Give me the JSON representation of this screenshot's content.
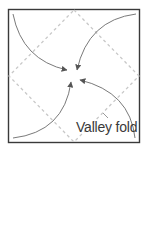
{
  "diagram": {
    "label": "Valley fold",
    "colors": {
      "border": "#3a3a3a",
      "dashed": "#c8c8c8",
      "arrow": "#7a7a7a",
      "text": "#3a3a3a"
    },
    "square": {
      "x": 8,
      "y": 9,
      "w": 132,
      "h": 134
    },
    "diamond": [
      [
        74,
        9
      ],
      [
        140,
        76
      ],
      [
        74,
        143
      ],
      [
        8,
        76
      ]
    ],
    "arrows": [
      {
        "from": "top-left",
        "to": "center"
      },
      {
        "from": "top-right",
        "to": "center"
      },
      {
        "from": "bottom-left",
        "to": "center"
      },
      {
        "from": "bottom-right",
        "to": "center"
      }
    ]
  }
}
